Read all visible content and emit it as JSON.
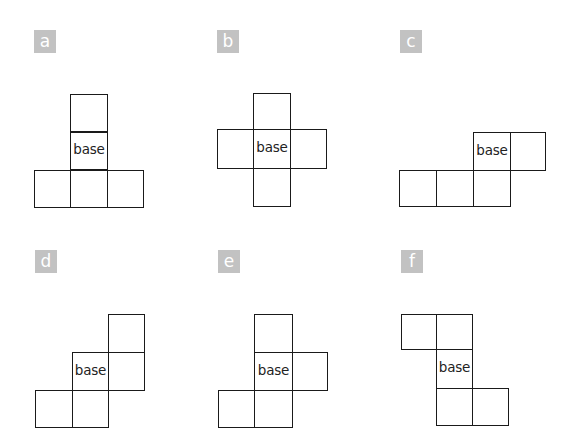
{
  "diagram": {
    "type": "cube-nets",
    "base_label": "base",
    "badge_color": "#c2c2c2",
    "line_color": "#1a1a1a",
    "cell_size_px": 37,
    "nets": [
      {
        "label": "a",
        "badge": {
          "x": 34,
          "y": 30
        },
        "cells": [
          {
            "x": 70,
            "y": 94,
            "w": 38,
            "h": 38,
            "base": false
          },
          {
            "x": 70,
            "y": 132,
            "w": 38,
            "h": 38,
            "base": true
          },
          {
            "x": 34,
            "y": 170,
            "w": 37,
            "h": 38,
            "base": false
          },
          {
            "x": 70,
            "y": 170,
            "w": 38,
            "h": 38,
            "base": false
          },
          {
            "x": 107,
            "y": 170,
            "w": 37,
            "h": 38,
            "base": false
          }
        ]
      },
      {
        "label": "b",
        "badge": {
          "x": 217,
          "y": 30
        },
        "cells": [
          {
            "x": 253,
            "y": 93,
            "w": 38,
            "h": 37,
            "base": false
          },
          {
            "x": 217,
            "y": 129,
            "w": 37,
            "h": 40,
            "base": false
          },
          {
            "x": 253,
            "y": 129,
            "w": 38,
            "h": 40,
            "base": true
          },
          {
            "x": 290,
            "y": 129,
            "w": 37,
            "h": 40,
            "base": false
          },
          {
            "x": 253,
            "y": 168,
            "w": 38,
            "h": 39,
            "base": false
          }
        ]
      },
      {
        "label": "c",
        "badge": {
          "x": 400,
          "y": 30
        },
        "cells": [
          {
            "x": 473,
            "y": 132,
            "w": 38,
            "h": 39,
            "base": true
          },
          {
            "x": 510,
            "y": 132,
            "w": 36,
            "h": 39,
            "base": false
          },
          {
            "x": 399,
            "y": 170,
            "w": 38,
            "h": 37,
            "base": false
          },
          {
            "x": 436,
            "y": 170,
            "w": 38,
            "h": 37,
            "base": false
          },
          {
            "x": 473,
            "y": 170,
            "w": 38,
            "h": 37,
            "base": false
          }
        ]
      },
      {
        "label": "d",
        "badge": {
          "x": 35,
          "y": 250
        },
        "cells": [
          {
            "x": 108,
            "y": 314,
            "w": 37,
            "h": 39,
            "base": false
          },
          {
            "x": 72,
            "y": 352,
            "w": 37,
            "h": 39,
            "base": true
          },
          {
            "x": 108,
            "y": 352,
            "w": 37,
            "h": 39,
            "base": false
          },
          {
            "x": 35,
            "y": 390,
            "w": 38,
            "h": 38,
            "base": false
          },
          {
            "x": 72,
            "y": 390,
            "w": 37,
            "h": 38,
            "base": false
          }
        ]
      },
      {
        "label": "e",
        "badge": {
          "x": 218,
          "y": 250
        },
        "cells": [
          {
            "x": 254,
            "y": 314,
            "w": 39,
            "h": 39,
            "base": false
          },
          {
            "x": 254,
            "y": 352,
            "w": 39,
            "h": 39,
            "base": true
          },
          {
            "x": 292,
            "y": 352,
            "w": 36,
            "h": 39,
            "base": false
          },
          {
            "x": 218,
            "y": 390,
            "w": 37,
            "h": 38,
            "base": false
          },
          {
            "x": 254,
            "y": 390,
            "w": 39,
            "h": 38,
            "base": false
          }
        ]
      },
      {
        "label": "f",
        "badge": {
          "x": 401,
          "y": 250
        },
        "cells": [
          {
            "x": 401,
            "y": 314,
            "w": 36,
            "h": 36,
            "base": false
          },
          {
            "x": 436,
            "y": 314,
            "w": 37,
            "h": 36,
            "base": false
          },
          {
            "x": 436,
            "y": 349,
            "w": 37,
            "h": 40,
            "base": true
          },
          {
            "x": 436,
            "y": 388,
            "w": 37,
            "h": 38,
            "base": false
          },
          {
            "x": 472,
            "y": 388,
            "w": 37,
            "h": 38,
            "base": false
          }
        ]
      }
    ]
  }
}
